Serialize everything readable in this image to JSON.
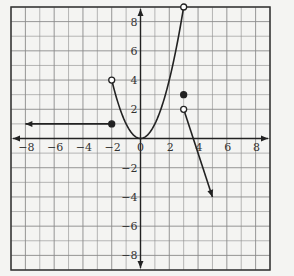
{
  "chart_data": {
    "type": "line",
    "title": "",
    "xlabel": "",
    "ylabel": "",
    "xlim": [
      -9,
      9
    ],
    "ylim": [
      -9,
      9
    ],
    "grid": true,
    "x_tick_labels": [
      "-8",
      "-6",
      "-4",
      "-2",
      "0",
      "2",
      "4",
      "6",
      "8"
    ],
    "y_tick_labels": [
      "8",
      "6",
      "4",
      "2",
      "-2",
      "-4",
      "-6",
      "-8"
    ],
    "pieces": [
      {
        "name": "left-ray",
        "kind": "ray",
        "from": [
          -2,
          1
        ],
        "to": [
          -8,
          1
        ],
        "from_endpoint": "closed",
        "to_endpoint": "arrow",
        "equation": "y = 1, x <= -2"
      },
      {
        "name": "parabola",
        "kind": "curve",
        "equation": "y = x^2, -2 < x < 3",
        "from": [
          -2,
          4
        ],
        "to": [
          3,
          9
        ],
        "from_endpoint": "open",
        "to_endpoint": "open",
        "vertex": [
          0,
          0
        ]
      },
      {
        "name": "isolated-point",
        "kind": "point",
        "at": [
          3,
          3
        ],
        "endpoint": "closed"
      },
      {
        "name": "right-ray",
        "kind": "ray",
        "from": [
          3,
          2
        ],
        "to": [
          5,
          -4
        ],
        "from_endpoint": "open",
        "to_endpoint": "arrow",
        "equation": "y = -3x + 11, x > 3"
      }
    ]
  },
  "colors": {
    "grid": "#8a8a8a",
    "frame": "#333333",
    "curve": "#222222",
    "background": "#f4f4f2"
  }
}
